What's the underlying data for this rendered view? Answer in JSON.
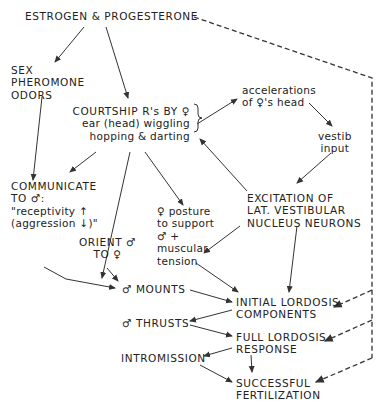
{
  "diagram": {
    "nodes": {
      "hormones": {
        "lines": [
          "ESTROGEN & PROGESTERONE"
        ]
      },
      "pheromone": {
        "lines": [
          "SEX",
          "PHEROMONE",
          "ODORS"
        ]
      },
      "courtship": {
        "lines": [
          "COURTSHIP R's BY ♀",
          "ear (head) wiggling",
          "hopping & darting"
        ]
      },
      "accelerations": {
        "lines": [
          "accelerations",
          "of ♀'s head"
        ]
      },
      "vestib": {
        "lines": [
          "vestib",
          "input"
        ]
      },
      "communicate": {
        "lines": [
          "COMMUNICATE",
          "TO ♂:",
          "\"receptivity ↑",
          "(aggression ↓)\""
        ]
      },
      "excitation": {
        "lines": [
          "EXCITATION OF",
          "LAT. VESTIBULAR",
          "NUCLEUS NEURONS"
        ]
      },
      "posture": {
        "lines": [
          "♀ posture",
          "to support",
          "♂ +",
          "muscular",
          "tension"
        ]
      },
      "orient": {
        "lines": [
          "ORIENT ♂",
          "TO ♀"
        ]
      },
      "mounts": {
        "lines": [
          "♂ MOUNTS"
        ]
      },
      "initial_lordosis": {
        "lines": [
          "INITIAL LORDOSIS",
          "COMPONENTS"
        ]
      },
      "thrusts": {
        "lines": [
          "♂ THRUSTS"
        ]
      },
      "full_lordosis": {
        "lines": [
          "FULL LORDOSIS",
          "RESPONSE"
        ]
      },
      "intromission": {
        "lines": [
          "INTROMISSION"
        ]
      },
      "fertilization": {
        "lines": [
          "SUCCESSFUL",
          "FERTILIZATION"
        ]
      }
    },
    "line_color": "#333333"
  }
}
